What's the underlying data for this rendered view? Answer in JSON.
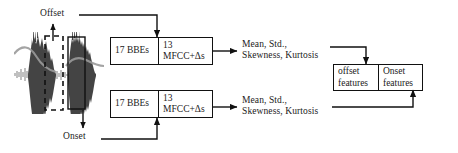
{
  "diagram": {
    "signal": {
      "name": "audio-waveform",
      "description": "Speech waveform with two energy bursts",
      "offset_region_style": "dashed-rectangle",
      "onset_region_style": "solid-rectangle"
    },
    "labels": {
      "offset": "Offset",
      "onset": "Onset"
    },
    "feature_blocks": [
      {
        "id": "offset-features-block",
        "left_cell": "17 BBEs",
        "right_cell_line1": "13",
        "right_cell_line2": "MFCC+Δs"
      },
      {
        "id": "onset-features-block",
        "left_cell": "17 BBEs",
        "right_cell_line1": "13",
        "right_cell_line2": "MFCC+Δs"
      }
    ],
    "statistics": [
      {
        "id": "offset-statistics",
        "line1": "Mean, Std.,",
        "line2": "Skewness, Kurtosis"
      },
      {
        "id": "onset-statistics",
        "line1": "Mean, Std.,",
        "line2": "Skewness, Kurtosis"
      }
    ],
    "output_box": {
      "offset_line1": "offset",
      "offset_line2": "features",
      "onset_line1": "Onset",
      "onset_line2": "features"
    },
    "colors": {
      "stroke": "#111111",
      "text": "#1a1a1a",
      "waveform": "#3a3a3a",
      "background": "#ffffff"
    }
  }
}
